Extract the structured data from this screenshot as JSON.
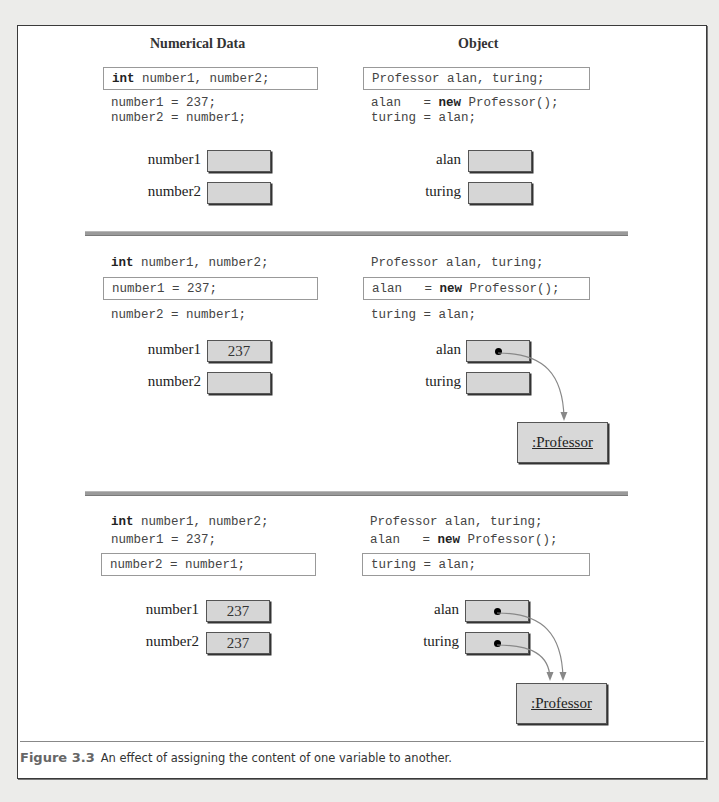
{
  "headings": {
    "numerical": "Numerical Data",
    "object": "Object"
  },
  "panels": [
    {
      "left_code": [
        {
          "kw": "int",
          "rest": " number1, number2;"
        },
        {
          "kw": "",
          "rest": "number1 = 237;"
        },
        {
          "kw": "",
          "rest": "number2 = number1;"
        }
      ],
      "left_boxed_index": 0,
      "right_code": [
        {
          "pre": "Professor alan, turing;",
          "kw": "",
          "post": ""
        },
        {
          "pre": "alan   = ",
          "kw": "new",
          "post": " Professor();"
        },
        {
          "pre": "turing = alan;",
          "kw": "",
          "post": ""
        }
      ],
      "right_boxed_index": 0,
      "left_vars": [
        {
          "name": "number1",
          "value": ""
        },
        {
          "name": "number2",
          "value": ""
        }
      ],
      "right_vars": [
        {
          "name": "alan",
          "points_to": false
        },
        {
          "name": "turing",
          "points_to": false
        }
      ],
      "object_label": ""
    },
    {
      "left_code": [
        {
          "kw": "int",
          "rest": " number1, number2;"
        },
        {
          "kw": "",
          "rest": "number1 = 237;"
        },
        {
          "kw": "",
          "rest": "number2 = number1;"
        }
      ],
      "left_boxed_index": 1,
      "right_code": [
        {
          "pre": "Professor alan, turing;",
          "kw": "",
          "post": ""
        },
        {
          "pre": "alan   = ",
          "kw": "new",
          "post": " Professor();"
        },
        {
          "pre": "turing = alan;",
          "kw": "",
          "post": ""
        }
      ],
      "right_boxed_index": 1,
      "left_vars": [
        {
          "name": "number1",
          "value": "237"
        },
        {
          "name": "number2",
          "value": ""
        }
      ],
      "right_vars": [
        {
          "name": "alan",
          "points_to": true
        },
        {
          "name": "turing",
          "points_to": false
        }
      ],
      "object_label": ":Professor"
    },
    {
      "left_code": [
        {
          "kw": "int",
          "rest": " number1, number2;"
        },
        {
          "kw": "",
          "rest": "number1 = 237;"
        },
        {
          "kw": "",
          "rest": "number2 = number1;"
        }
      ],
      "left_boxed_index": 2,
      "right_code": [
        {
          "pre": "Professor alan, turing;",
          "kw": "",
          "post": ""
        },
        {
          "pre": "alan   = ",
          "kw": "new",
          "post": " Professor();"
        },
        {
          "pre": "turing = alan;",
          "kw": "",
          "post": ""
        }
      ],
      "right_boxed_index": 2,
      "left_vars": [
        {
          "name": "number1",
          "value": "237"
        },
        {
          "name": "number2",
          "value": "237"
        }
      ],
      "right_vars": [
        {
          "name": "alan",
          "points_to": true
        },
        {
          "name": "turing",
          "points_to": true
        }
      ],
      "object_label": ":Professor"
    }
  ],
  "caption": {
    "figure": "Figure 3.3",
    "text": "An effect of assigning the content of one variable to another."
  },
  "colors": {
    "cell_fill": "#d6d6d6",
    "arrow": "#888888",
    "caption_figure": "#666666"
  }
}
